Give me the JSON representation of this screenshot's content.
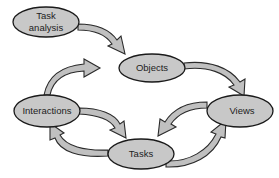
{
  "diagram": {
    "colors": {
      "node_fill": "#c8c8c8",
      "node_stroke": "#1a1a1a",
      "arrow_fill": "#c0c0c0",
      "arrow_stroke": "#2a2a2a",
      "background": "#ffffff"
    },
    "nodes": [
      {
        "id": "task-analysis",
        "lines": [
          "Task",
          "analysis"
        ]
      },
      {
        "id": "objects",
        "lines": [
          "Objects"
        ]
      },
      {
        "id": "views",
        "lines": [
          "Views"
        ]
      },
      {
        "id": "interactions",
        "lines": [
          "Interactions"
        ]
      },
      {
        "id": "tasks",
        "lines": [
          "Tasks"
        ]
      }
    ],
    "edges": [
      {
        "from": "task-analysis",
        "to": "objects"
      },
      {
        "from": "objects",
        "to": "views"
      },
      {
        "from": "views",
        "to": "tasks"
      },
      {
        "from": "tasks",
        "to": "views"
      },
      {
        "from": "interactions",
        "to": "objects"
      },
      {
        "from": "interactions",
        "to": "tasks"
      },
      {
        "from": "tasks",
        "to": "interactions"
      }
    ]
  }
}
